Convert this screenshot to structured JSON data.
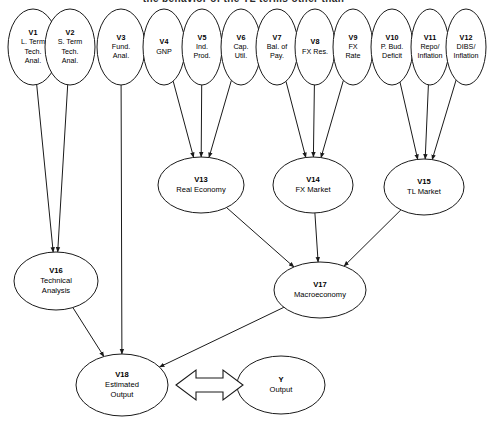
{
  "heading": {
    "clipped_text": "the behavior of the TL terms other than"
  },
  "diagram": {
    "colors": {
      "stroke": "#1a1a1a",
      "node_fill": "#ffffff",
      "background": "#ffffff",
      "text": "#000000"
    },
    "nodes": [
      {
        "id": "V1",
        "lines": [
          "V1",
          "L. Term",
          "Tech.",
          "Anal."
        ],
        "cx": 33,
        "cy": 47,
        "rx": 25,
        "ry": 38
      },
      {
        "id": "V2",
        "lines": [
          "V2",
          "S. Term",
          "Tech.",
          "Anal."
        ],
        "cx": 70,
        "cy": 47,
        "rx": 25,
        "ry": 38
      },
      {
        "id": "V3",
        "lines": [
          "V3",
          "Fund.",
          "Anal."
        ],
        "cx": 121,
        "cy": 47,
        "rx": 24,
        "ry": 38
      },
      {
        "id": "V4",
        "lines": [
          "V4",
          "GNP"
        ],
        "cx": 164,
        "cy": 47,
        "rx": 21,
        "ry": 38
      },
      {
        "id": "V5",
        "lines": [
          "V5",
          "Ind.",
          "Prod."
        ],
        "cx": 202,
        "cy": 47,
        "rx": 20,
        "ry": 38
      },
      {
        "id": "V6",
        "lines": [
          "V6",
          "Cap.",
          "Util."
        ],
        "cx": 241,
        "cy": 47,
        "rx": 20,
        "ry": 38
      },
      {
        "id": "V7",
        "lines": [
          "V7",
          "Bal. of",
          "Pay."
        ],
        "cx": 277,
        "cy": 47,
        "rx": 21,
        "ry": 38
      },
      {
        "id": "V8",
        "lines": [
          "V8",
          "FX Res."
        ],
        "cx": 315,
        "cy": 47,
        "rx": 20,
        "ry": 38
      },
      {
        "id": "V9",
        "lines": [
          "V9",
          "FX",
          "Rate"
        ],
        "cx": 353,
        "cy": 47,
        "rx": 20,
        "ry": 38
      },
      {
        "id": "V10",
        "lines": [
          "V10",
          "P. Bud.",
          "Deficit"
        ],
        "cx": 392,
        "cy": 47,
        "rx": 21,
        "ry": 38
      },
      {
        "id": "V11",
        "lines": [
          "V11",
          "Repo/",
          "Inflation"
        ],
        "cx": 430,
        "cy": 47,
        "rx": 19,
        "ry": 38
      },
      {
        "id": "V12",
        "lines": [
          "V12",
          "DIBS/",
          "Inflation"
        ],
        "cx": 466,
        "cy": 47,
        "rx": 20,
        "ry": 38
      },
      {
        "id": "V13",
        "lines": [
          "V13",
          "Real Economy"
        ],
        "cx": 201,
        "cy": 185,
        "rx": 43,
        "ry": 28
      },
      {
        "id": "V14",
        "lines": [
          "V14",
          "FX Market"
        ],
        "cx": 313,
        "cy": 185,
        "rx": 40,
        "ry": 28
      },
      {
        "id": "V15",
        "lines": [
          "V15",
          "TL Market"
        ],
        "cx": 424,
        "cy": 187,
        "rx": 40,
        "ry": 28
      },
      {
        "id": "V16",
        "lines": [
          "V16",
          "Technical",
          "Analysis"
        ],
        "cx": 56,
        "cy": 281,
        "rx": 42,
        "ry": 29
      },
      {
        "id": "V17",
        "lines": [
          "V17",
          "Macroeconomy"
        ],
        "cx": 320,
        "cy": 290,
        "rx": 46,
        "ry": 28
      },
      {
        "id": "V18",
        "lines": [
          "V18",
          "Estimated",
          "Output"
        ],
        "cx": 122,
        "cy": 385,
        "rx": 46,
        "ry": 31
      },
      {
        "id": "Y",
        "lines": [
          "Y",
          "Output"
        ],
        "cx": 281,
        "cy": 385,
        "rx": 44,
        "ry": 29
      }
    ],
    "edges": [
      {
        "from": "V1",
        "to": "V16",
        "arrow": true
      },
      {
        "from": "V2",
        "to": "V16",
        "arrow": true
      },
      {
        "from": "V3",
        "to": "V18",
        "arrow": true
      },
      {
        "from": "V4",
        "to": "V13",
        "arrow": true
      },
      {
        "from": "V5",
        "to": "V13",
        "arrow": true
      },
      {
        "from": "V6",
        "to": "V13",
        "arrow": true
      },
      {
        "from": "V7",
        "to": "V14",
        "arrow": true
      },
      {
        "from": "V8",
        "to": "V14",
        "arrow": true
      },
      {
        "from": "V9",
        "to": "V14",
        "arrow": true
      },
      {
        "from": "V10",
        "to": "V15",
        "arrow": true
      },
      {
        "from": "V11",
        "to": "V15",
        "arrow": true
      },
      {
        "from": "V12",
        "to": "V15",
        "arrow": true
      },
      {
        "from": "V13",
        "to": "V17",
        "arrow": true
      },
      {
        "from": "V14",
        "to": "V17",
        "arrow": true
      },
      {
        "from": "V15",
        "to": "V17",
        "arrow": true
      },
      {
        "from": "V16",
        "to": "V18",
        "arrow": true
      },
      {
        "from": "V17",
        "to": "V18",
        "arrow": true
      }
    ],
    "block_arrow": {
      "from": "V18",
      "to": "Y",
      "double_headed": true
    }
  }
}
